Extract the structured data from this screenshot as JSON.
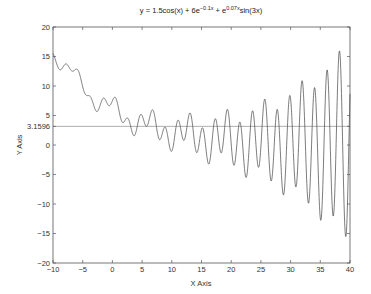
{
  "chart_data": {
    "type": "line",
    "title_parts": {
      "base": "y = 1.5cos(x) + 6e",
      "exp1": "−0.1x",
      "mid": " + e",
      "exp2": "0.07x",
      "tail": "sin(3x)"
    },
    "xlabel": "X Axis",
    "ylabel": "Y Axis",
    "xlim": [
      -10,
      40
    ],
    "ylim": [
      -20,
      20
    ],
    "xticks": [
      -10,
      -5,
      0,
      5,
      10,
      15,
      20,
      25,
      30,
      35,
      40
    ],
    "yticks": [
      -20,
      -15,
      -10,
      -5,
      0,
      3.1596,
      5,
      10,
      15,
      20
    ],
    "ytick_labels": [
      "−20",
      "−15",
      "−10",
      "−5",
      "0",
      "3.1596",
      "5",
      "10",
      "15",
      "20"
    ],
    "xtick_labels": [
      "−10",
      "−5",
      "0",
      "5",
      "10",
      "15",
      "20",
      "25",
      "30",
      "35",
      "40"
    ],
    "grid": false,
    "series": [
      {
        "name": "y(x)",
        "formula": "1.5*cos(x) + 6*exp(-0.1*x) + exp(0.07*x)*sin(3*x)",
        "color": "#444444"
      }
    ],
    "annotations": [
      {
        "type": "hline",
        "y": 3.1596,
        "label": "3.1596",
        "color": "#888888"
      }
    ]
  },
  "colors": {
    "axis": "#555555",
    "curve": "#444444",
    "hline": "#999999",
    "background": "#ffffff"
  }
}
